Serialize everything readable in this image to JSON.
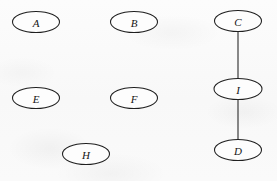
{
  "diagram": {
    "type": "node-link-graph",
    "background_color": "#fbfbfb",
    "node_fill_color": "#fdfdfd",
    "node_stroke_color": "#1f1f1f",
    "edge_stroke_color": "#2a2a2a",
    "label_color": "#151515",
    "canvas": {
      "width": 277,
      "height": 181
    },
    "nodes": [
      {
        "id": "A",
        "label": "A",
        "cx": 36,
        "cy": 22,
        "rx": 23.5,
        "ry": 10.5
      },
      {
        "id": "B",
        "label": "B",
        "cx": 134,
        "cy": 22,
        "rx": 23.5,
        "ry": 10.5
      },
      {
        "id": "C",
        "label": "C",
        "cx": 238,
        "cy": 21,
        "rx": 23.5,
        "ry": 10.5
      },
      {
        "id": "E",
        "label": "E",
        "cx": 36,
        "cy": 98,
        "rx": 23.5,
        "ry": 10.5
      },
      {
        "id": "F",
        "label": "F",
        "cx": 134,
        "cy": 98,
        "rx": 23.5,
        "ry": 10.5
      },
      {
        "id": "I",
        "label": "I",
        "cx": 238,
        "cy": 89,
        "rx": 24.0,
        "ry": 10.5
      },
      {
        "id": "H",
        "label": "H",
        "cx": 86,
        "cy": 154,
        "rx": 23.5,
        "ry": 10.5
      },
      {
        "id": "D",
        "label": "D",
        "cx": 238,
        "cy": 150,
        "rx": 23.5,
        "ry": 10.5
      }
    ],
    "edges": [
      {
        "id": "C-I",
        "source": "C",
        "target": "I",
        "x1": 238,
        "y1": 32,
        "x2": 238,
        "y2": 79
      },
      {
        "id": "I-D",
        "source": "I",
        "target": "D",
        "x1": 238,
        "y1": 100,
        "x2": 238,
        "y2": 140
      }
    ],
    "isolated_nodes": [
      "A",
      "B",
      "E",
      "F",
      "H"
    ],
    "node_count": 8,
    "edge_count": 2
  }
}
